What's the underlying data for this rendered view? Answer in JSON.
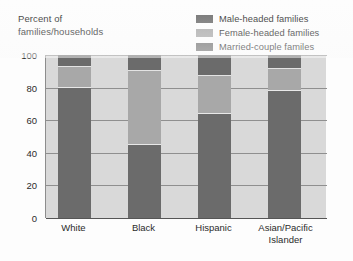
{
  "chart_data": {
    "type": "bar",
    "subtype": "stacked-bar-100",
    "title": "",
    "ylabel": "Percent of\nfamilies/households",
    "xlabel": "",
    "ylim": [
      0,
      100
    ],
    "yticks": [
      0,
      20,
      40,
      60,
      80,
      100
    ],
    "ytick_labels": [
      "0",
      "20",
      "40",
      "60",
      "80",
      "100"
    ],
    "grid": true,
    "legend_position": "top-right",
    "categories": [
      "White",
      "Black",
      "Hispanic",
      "Asian/​Pacific Islander"
    ],
    "category_labels": [
      "White",
      "Black",
      "Hispanic",
      "Asian/Pacific\nIslander"
    ],
    "series": [
      {
        "name": "Married-couple familes",
        "color": "#6b6b6b",
        "values": [
          80,
          45,
          64,
          78
        ]
      },
      {
        "name": "Female-headed families",
        "color": "#a8a8a8",
        "values": [
          13,
          46,
          24,
          14
        ]
      },
      {
        "name": "Male-headed families",
        "color": "#6b6b6b",
        "values": [
          7,
          9,
          12,
          8
        ]
      }
    ],
    "stack_order_bottom_to_top": [
      "Married-couple familes",
      "Female-headed families",
      "Male-headed families"
    ],
    "plot_background": "#d9d9d9",
    "page_background": "#fdfdfd"
  },
  "legend": {
    "items": [
      {
        "label": "Male-headed families",
        "color": "#6b6b6b"
      },
      {
        "label": "Female-headed families",
        "color": "#a8a8a8"
      },
      {
        "label": "Married-couple familes",
        "color": "#6b6b6b"
      }
    ]
  },
  "axis": {
    "y_title": "Percent of\nfamilies/households",
    "y_ticks": [
      "100",
      "80",
      "60",
      "40",
      "20",
      "0"
    ],
    "x_ticks": [
      "White",
      "Black",
      "Hispanic",
      "Asian/Pacific\nIslander"
    ]
  },
  "credit": ""
}
